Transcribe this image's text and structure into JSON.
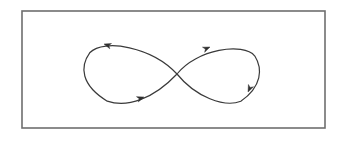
{
  "figure": {
    "kind": "line-diagram",
    "canvas": {
      "width": 341,
      "height": 144,
      "background": "#ffffff"
    },
    "frame": {
      "name": "bounding-rectangle",
      "x": 22,
      "y": 11,
      "width": 303,
      "height": 117,
      "stroke": "#6e6e6e",
      "stroke_width": 1.6,
      "fill": "#ffffff"
    },
    "curve": {
      "name": "lemniscate-path",
      "stroke": "#3a3a3a",
      "stroke_width": 1.2,
      "fill": "none",
      "crossing_point": {
        "x": 177,
        "y": 74
      },
      "extent": {
        "left": 88,
        "right": 256,
        "top": 40,
        "bottom": 103
      },
      "left_loop": {
        "direction": "counterclockwise",
        "center": {
          "x": 132,
          "y": 72
        },
        "rx": 45,
        "ry": 31
      },
      "right_loop": {
        "direction": "clockwise",
        "center": {
          "x": 221,
          "y": 74
        },
        "rx": 36,
        "ry": 29
      },
      "path_d": "M 177 74 C 160 48 130 36 110 43 C 90 50 86 72 92 86 C 98 100 120 105 140 98 C 160 91 170 82 177 74 C 186 64 196 52 212 47 C 232 41 252 52 254 70 C 256 88 242 100 226 101 C 208 102 190 88 177 74 Z"
    },
    "arrows": [
      {
        "name": "arrow-left-loop-top",
        "tip": {
          "x": 104,
          "y": 44
        },
        "angle_deg": 198,
        "size": 7,
        "color": "#2f2f2f",
        "meaning": "flow-leftward-along-top-of-left-loop"
      },
      {
        "name": "arrow-left-loop-bottom",
        "tip": {
          "x": 144,
          "y": 97
        },
        "angle_deg": -19,
        "size": 7,
        "color": "#2f2f2f",
        "meaning": "flow-rightward-along-bottom-of-left-loop"
      },
      {
        "name": "arrow-right-loop-top",
        "tip": {
          "x": 210,
          "y": 47
        },
        "angle_deg": -23,
        "size": 7,
        "color": "#2f2f2f",
        "meaning": "flow-rightward-along-top-of-right-loop"
      },
      {
        "name": "arrow-right-loop-right",
        "tip": {
          "x": 248,
          "y": 92
        },
        "angle_deg": 115,
        "size": 7,
        "color": "#2f2f2f",
        "meaning": "flow-downward-along-right-side-of-right-loop"
      }
    ]
  },
  "labels": {
    "figure_title": "",
    "caption": ""
  }
}
